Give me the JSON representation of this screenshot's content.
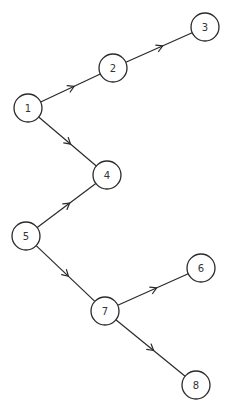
{
  "diagram": {
    "type": "directed-graph",
    "style": {
      "stroke": "#2a2a2a",
      "background": "#ffffff",
      "node_radius": 14
    },
    "nodes": [
      {
        "id": "1",
        "label": "1",
        "x": 28,
        "y": 108
      },
      {
        "id": "2",
        "label": "2",
        "x": 113,
        "y": 68
      },
      {
        "id": "3",
        "label": "3",
        "x": 205,
        "y": 27
      },
      {
        "id": "4",
        "label": "4",
        "x": 107,
        "y": 175
      },
      {
        "id": "5",
        "label": "5",
        "x": 26,
        "y": 236
      },
      {
        "id": "6",
        "label": "6",
        "x": 201,
        "y": 268
      },
      {
        "id": "7",
        "label": "7",
        "x": 105,
        "y": 311
      },
      {
        "id": "8",
        "label": "8",
        "x": 196,
        "y": 385
      }
    ],
    "edges": [
      {
        "from": "1",
        "to": "2"
      },
      {
        "from": "2",
        "to": "3"
      },
      {
        "from": "1",
        "to": "4"
      },
      {
        "from": "5",
        "to": "4"
      },
      {
        "from": "5",
        "to": "7"
      },
      {
        "from": "7",
        "to": "6"
      },
      {
        "from": "7",
        "to": "8"
      }
    ]
  }
}
